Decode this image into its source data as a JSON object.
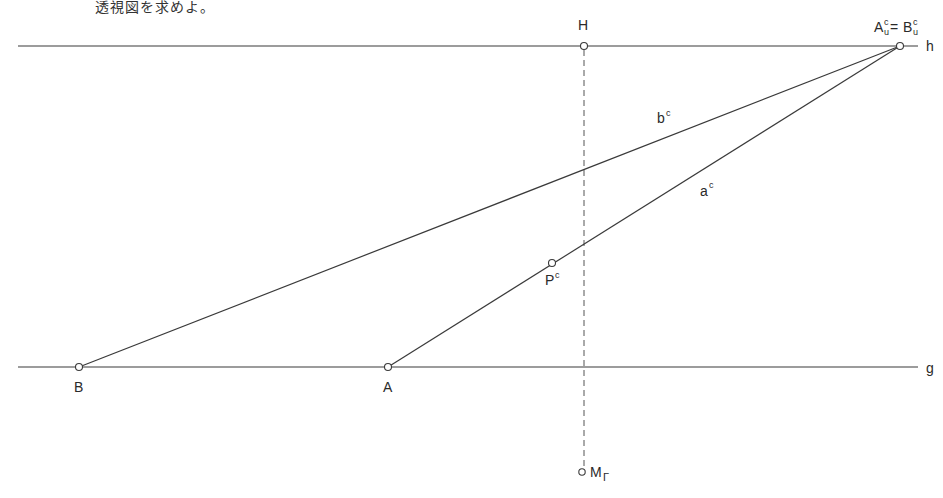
{
  "caption": "透視図を求めよ。",
  "labels": {
    "H": "H",
    "h": "h",
    "g": "g",
    "A": "A",
    "B": "B",
    "vanishing_point": {
      "A": "A",
      "eq": "=",
      "B": "B",
      "sup": "c",
      "sub": "u"
    },
    "bc": {
      "base": "b",
      "sup": "c"
    },
    "ac": {
      "base": "a",
      "sup": "c"
    },
    "Pc": {
      "base": "P",
      "sup": "c"
    },
    "M": {
      "base": "M",
      "sub": "Γ"
    }
  },
  "geometry": {
    "horizon_line_y": 46,
    "ground_line_y": 367,
    "H": [
      584,
      46
    ],
    "vanishing_point": [
      900,
      46
    ],
    "B": [
      79,
      367
    ],
    "A": [
      388,
      367
    ],
    "Pc": [
      552,
      263
    ],
    "M": [
      584,
      472
    ],
    "line_left_x": 18,
    "line_right_x": 918
  },
  "colors": {
    "ink": "#3a3a3a",
    "background": "#ffffff"
  }
}
